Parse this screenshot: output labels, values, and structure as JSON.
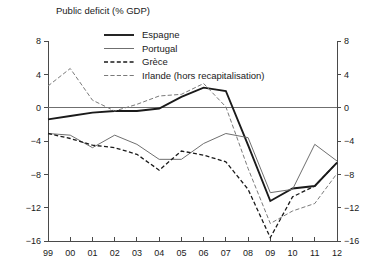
{
  "chart_data": {
    "type": "line",
    "title": "Public deficit (% GDP)",
    "xlabel": "",
    "ylabel": "",
    "x": [
      "99",
      "00",
      "01",
      "02",
      "03",
      "04",
      "05",
      "06",
      "07",
      "08",
      "09",
      "10",
      "11",
      "12"
    ],
    "xtick_labels": [
      "99",
      "00",
      "01",
      "02",
      "03",
      "04",
      "05",
      "06",
      "07",
      "08",
      "09",
      "10",
      "11",
      "12"
    ],
    "ytick_labels": [
      "8",
      "4",
      "0",
      "−4",
      "−8",
      "−12",
      "−16"
    ],
    "ytick_values": [
      8,
      4,
      0,
      -4,
      -8,
      -12,
      -16
    ],
    "ylim": [
      -16,
      8
    ],
    "grid": false,
    "zero_line": true,
    "dual_y_axis": true,
    "legend_position": "top-center",
    "series": [
      {
        "name": "Espagne",
        "style": "solid-thick",
        "color": "#1a1a1a",
        "width": 1.9,
        "dash": "none",
        "values": [
          -1.4,
          -1.0,
          -0.6,
          -0.4,
          -0.4,
          -0.1,
          1.3,
          2.4,
          2.0,
          -4.5,
          -11.2,
          -9.7,
          -9.4,
          -6.6
        ]
      },
      {
        "name": "Portugal",
        "style": "solid-thin",
        "color": "#6f6f6f",
        "width": 1.0,
        "dash": "none",
        "values": [
          -3.1,
          -3.3,
          -4.8,
          -3.3,
          -4.4,
          -6.2,
          -6.2,
          -4.3,
          -3.1,
          -3.6,
          -10.2,
          -9.8,
          -4.4,
          -6.4
        ]
      },
      {
        "name": "Grèce",
        "style": "dashed",
        "color": "#1a1a1a",
        "width": 1.3,
        "dash": "4,2.4",
        "values": [
          -3.1,
          -3.7,
          -4.5,
          -4.8,
          -5.6,
          -7.5,
          -5.2,
          -5.7,
          -6.5,
          -9.8,
          -15.6,
          -10.7,
          -9.4,
          -6.6
        ]
      },
      {
        "name": "Irlande (hors recapitalisation)",
        "style": "dashed-thin",
        "color": "#7a7a7a",
        "width": 1.0,
        "dash": "4.2,2.2",
        "values": [
          2.6,
          4.7,
          0.9,
          -0.4,
          0.4,
          1.4,
          1.6,
          2.9,
          0.1,
          -7.3,
          -13.9,
          -12.4,
          -11.5,
          -7.9
        ]
      }
    ],
    "legend": [
      {
        "label": "Espagne",
        "series": 0
      },
      {
        "label": "Portugal",
        "series": 1
      },
      {
        "label": "Grèce",
        "series": 2
      },
      {
        "label": "Irlande (hors recapitalisation)",
        "series": 3
      }
    ]
  },
  "layout": {
    "plot_left": 48,
    "plot_right": 337,
    "plot_top": 41,
    "plot_bottom": 241,
    "title_x": 56,
    "title_y": 14,
    "legend_x": 104,
    "legend_y": 35,
    "legend_row_height": 13.5,
    "legend_line_length": 30
  }
}
